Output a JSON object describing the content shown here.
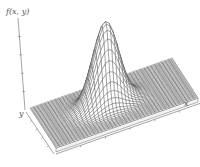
{
  "figure": {
    "axis_labels": {
      "z": "f(x, y)",
      "y": "y",
      "x": "x"
    },
    "colors": {
      "mesh": "#444444",
      "base": "#e8e8e8",
      "axis": "#666666"
    }
  }
}
